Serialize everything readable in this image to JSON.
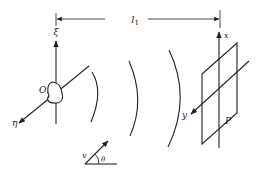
{
  "diagram": {
    "type": "physics-wave-propagation",
    "distance_label": "l",
    "distance_subscript": "1",
    "source": {
      "origin_label": "O",
      "axis_vertical_label": "ξ",
      "axis_diagonal_label": "η"
    },
    "plane": {
      "label": "P",
      "axis_vertical_label": "x",
      "axis_diagonal_label": "y"
    },
    "velocity": {
      "vector_label": "v",
      "angle_label": "θ"
    },
    "wavefronts_count": 3,
    "colors": {
      "ink": "#222222",
      "background": "#ffffff"
    }
  }
}
